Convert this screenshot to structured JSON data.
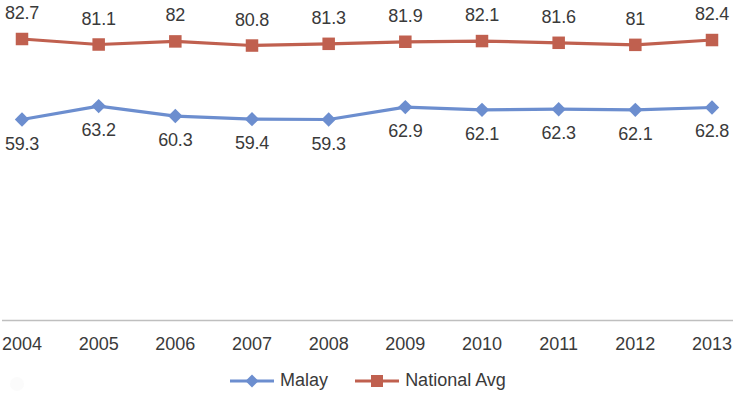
{
  "chart_data": {
    "type": "line",
    "title": "",
    "subtitle": "",
    "xlabel": "",
    "ylabel": "",
    "grid": false,
    "legend_position": "bottom-center",
    "axis_line": true,
    "categories": [
      "2004",
      "2005",
      "2006",
      "2007",
      "2008",
      "2009",
      "2010",
      "2011",
      "2012",
      "2013"
    ],
    "series": [
      {
        "name": "Malay",
        "color": "#6C8ECF",
        "marker": "diamond",
        "values": [
          59.3,
          63.2,
          60.3,
          59.4,
          59.3,
          62.9,
          62.1,
          62.3,
          62.1,
          62.8
        ],
        "labels": [
          "59.3",
          "63.2",
          "60.3",
          "59.4",
          "59.3",
          "62.9",
          "62.1",
          "62.3",
          "62.1",
          "62.8"
        ],
        "label_position": "below"
      },
      {
        "name": "National Avg",
        "color": "#C0604F",
        "marker": "square",
        "values": [
          82.7,
          81.1,
          82.0,
          80.8,
          81.3,
          81.9,
          82.1,
          81.6,
          81.0,
          82.4
        ],
        "labels": [
          "82.7",
          "81.1",
          "82",
          "80.8",
          "81.3",
          "81.9",
          "82.1",
          "81.6",
          "81",
          "82.4"
        ],
        "label_position": "above"
      }
    ],
    "ylim": [
      55,
      85
    ]
  },
  "legend": {
    "entries": [
      {
        "label": "Malay",
        "color": "#6C8ECF",
        "marker": "diamond"
      },
      {
        "label": "National Avg",
        "color": "#C0604F",
        "marker": "square"
      }
    ]
  },
  "axis": {
    "tick_labels": [
      "2004",
      "2005",
      "2006",
      "2007",
      "2008",
      "2009",
      "2010",
      "2011",
      "2012",
      "2013"
    ]
  },
  "colors": {
    "malay": "#6C8ECF",
    "national_avg": "#C0604F",
    "axis_line": "#BFBFBF",
    "text": "#3a3a3a",
    "background": "#ffffff"
  }
}
